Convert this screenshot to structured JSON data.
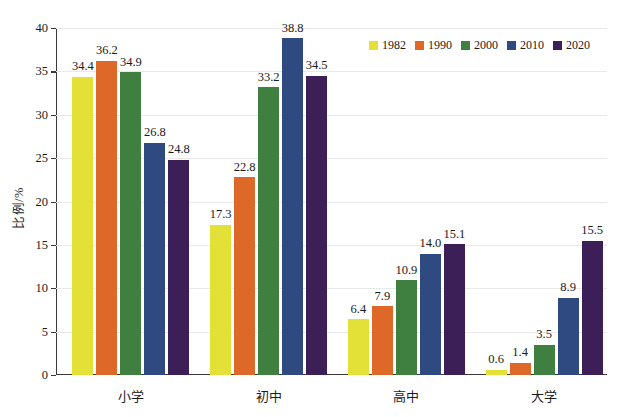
{
  "chart_data": {
    "type": "bar",
    "title": "",
    "subtitle": "",
    "xlabel": "",
    "ylabel": "比例/%",
    "ylim": [
      0,
      40
    ],
    "yticks": [
      0,
      5,
      10,
      15,
      20,
      25,
      30,
      35,
      40
    ],
    "ytick_labels": [
      "0",
      "5",
      "10",
      "15",
      "20",
      "25",
      "30",
      "35",
      "40"
    ],
    "grid": true,
    "legend_position": "top-right",
    "data_labels": true,
    "categories": [
      "小学",
      "初中",
      "高中",
      "大学"
    ],
    "series": [
      {
        "name": "1982",
        "color": "#e3e038",
        "values": [
          34.4,
          17.3,
          6.4,
          0.6
        ]
      },
      {
        "name": "1990",
        "color": "#de6827",
        "values": [
          36.2,
          22.8,
          7.9,
          1.4
        ]
      },
      {
        "name": "2000",
        "color": "#3f8040",
        "values": [
          34.9,
          33.2,
          10.9,
          3.5
        ]
      },
      {
        "name": "2010",
        "color": "#2e4a80",
        "values": [
          26.8,
          38.8,
          14.0,
          8.9
        ]
      },
      {
        "name": "2020",
        "color": "#3b1f56",
        "values": [
          24.8,
          34.5,
          15.1,
          15.5
        ]
      }
    ]
  }
}
